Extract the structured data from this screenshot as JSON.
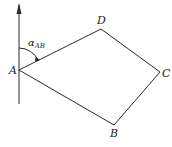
{
  "diagram": {
    "type": "quadrilateral-with-azimuth",
    "colors": {
      "line": "#2a2a2a",
      "text": "#222222",
      "background": "#ffffff"
    },
    "north_arrow": {
      "x": 19,
      "y_top": 4,
      "y_bottom": 104
    },
    "vertices": [
      {
        "label": "A",
        "x": 19,
        "y": 70,
        "label_x": 9,
        "label_y": 74
      },
      {
        "label": "D",
        "x": 101,
        "y": 29,
        "label_x": 97,
        "label_y": 24
      },
      {
        "label": "C",
        "x": 160,
        "y": 72,
        "label_x": 162,
        "label_y": 77
      },
      {
        "label": "B",
        "x": 114,
        "y": 125,
        "label_x": 110,
        "label_y": 137
      }
    ],
    "edges": [
      [
        "A",
        "D"
      ],
      [
        "D",
        "C"
      ],
      [
        "C",
        "B"
      ],
      [
        "B",
        "A"
      ]
    ],
    "angle_label": {
      "symbol": "α",
      "subscript": "AB",
      "x": 28,
      "y": 46
    }
  }
}
